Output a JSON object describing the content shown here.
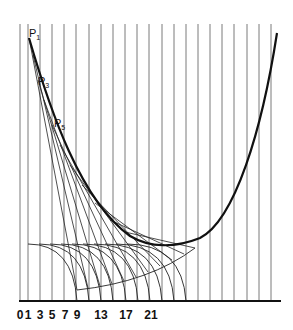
{
  "diagram": {
    "type": "involute-envelope construction",
    "tick_labels": [
      {
        "text": "0",
        "x": 20
      },
      {
        "text": "1",
        "x": 28
      },
      {
        "text": "3",
        "x": 40
      },
      {
        "text": "5",
        "x": 52
      },
      {
        "text": "7",
        "x": 65
      },
      {
        "text": "9",
        "x": 77
      },
      {
        "text": "13",
        "x": 101
      },
      {
        "text": "17",
        "x": 126
      },
      {
        "text": "21",
        "x": 151
      }
    ],
    "point_labels": [
      {
        "main": "P",
        "sub": "1",
        "x": 29,
        "y": 37
      },
      {
        "main": "P",
        "sub": "3",
        "x": 38,
        "y": 85
      },
      {
        "main": "P",
        "sub": "5",
        "x": 54,
        "y": 127
      }
    ],
    "colors": {
      "ink": "#111111",
      "grid": "#7a7a7a",
      "background": "#ffffff"
    }
  }
}
